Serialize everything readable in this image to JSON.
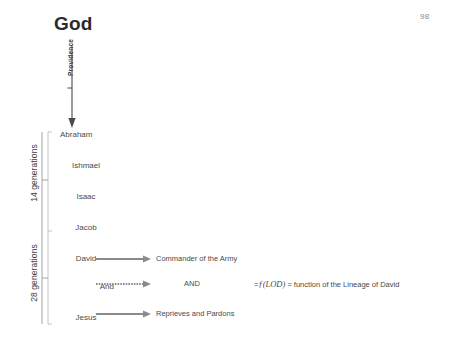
{
  "page": {
    "number": "98"
  },
  "title": {
    "god": "God"
  },
  "providence": {
    "label": "Providence",
    "arrow_icon": "down-arrow-icon"
  },
  "generations": [
    {
      "label": "14 generations"
    },
    {
      "label": "28 generations"
    }
  ],
  "lineage": [
    {
      "name": "Abraham"
    },
    {
      "name": "Ishmael"
    },
    {
      "name": "Isaac"
    },
    {
      "name": "Jacob"
    },
    {
      "name": "David"
    },
    {
      "name": "And"
    },
    {
      "name": "Jesus"
    }
  ],
  "relations": [
    {
      "source": "David",
      "arrow_icon": "right-arrow-icon",
      "caption": "Commander of the Army"
    },
    {
      "source": "And",
      "arrow_icon": "right-arrow-dashed-icon",
      "caption": "AND",
      "formula_prefix": "=",
      "formula_symbol": "ƒ(LOD)",
      "formula_suffix": "= function of the Lineage of David"
    },
    {
      "source": "Jesus",
      "arrow_icon": "right-arrow-icon",
      "caption": "Reprieves and Pardons"
    }
  ],
  "colors": {
    "text": "#4a4a4a",
    "heading": "#2b2b2b",
    "arrow": "#7f7f7f",
    "bracket": "#b5b5b5",
    "page_number": "#8a8a8a"
  }
}
